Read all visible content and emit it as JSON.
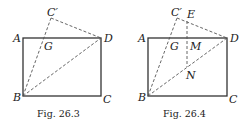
{
  "figures": [
    {
      "caption": "Fig. 26.3",
      "labels": {
        "A": "A",
        "B": "B",
        "C": "C",
        "D": "D",
        "Cp": "C′",
        "G": "G"
      }
    },
    {
      "caption": "Fig. 26.4",
      "labels": {
        "A": "A",
        "B": "B",
        "C": "C",
        "D": "D",
        "Cp": "C′",
        "G": "G",
        "E": "E",
        "M": "M",
        "N": "N"
      }
    }
  ]
}
